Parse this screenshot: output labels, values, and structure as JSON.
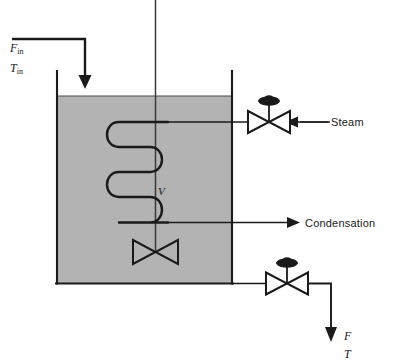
{
  "diagram": {
    "type": "process-flow-diagram",
    "colors": {
      "liquid_fill": "#b3b3b3",
      "line": "#1a1a1a",
      "background": "#ffffff"
    },
    "labels": {
      "flow_in": "F",
      "flow_in_sub": "in",
      "temp_in": "T",
      "temp_in_sub": "in",
      "volume": "V",
      "steam": "Steam",
      "condensation": "Condensation",
      "flow_out": "F",
      "temp_out": "T"
    },
    "components": {
      "tank": "Stirred tank vessel",
      "agitator": "Agitator shaft with impeller",
      "coil": "Steam heating coil",
      "steam_valve": "Steam control valve",
      "outlet_valve": "Outlet control valve"
    }
  }
}
